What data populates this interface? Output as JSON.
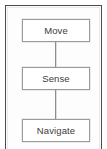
{
  "figure": {
    "type": "vertical-flowchart",
    "title": "",
    "frame": {
      "border_color": "#4a4a4a",
      "inner_line_color": "#e9e9e9",
      "background_color": "#fdfdfd"
    },
    "node_style": {
      "fill_color": "#ffffff",
      "border_color": "#9a9a9a",
      "text_color": "#3b3b3b"
    },
    "connector_style": {
      "color": "#8d8d8d",
      "direction": "vertical"
    },
    "nodes": [
      {
        "id": "move",
        "label": "Move"
      },
      {
        "id": "sense",
        "label": "Sense"
      },
      {
        "id": "navigate",
        "label": "Navigate"
      }
    ],
    "connectors": [
      {
        "from": "move",
        "to": "sense"
      },
      {
        "from": "sense",
        "to": "navigate"
      }
    ]
  }
}
